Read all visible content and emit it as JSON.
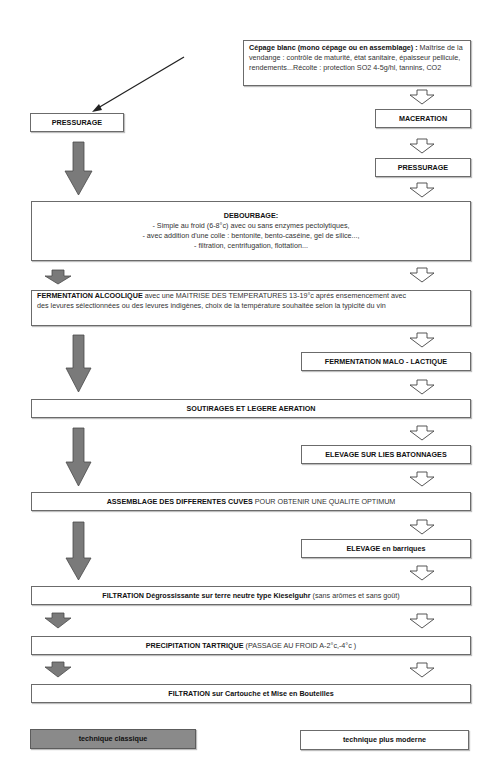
{
  "diagram": {
    "start_box": {
      "title": "Cépage blanc (mono cépage ou en assemblage) :",
      "line1_rest": " Maîtrise de la",
      "line2": "vendange : contrôle de maturité, état sanitaire, épaisseur pellicule,",
      "line3": "rendements...Récolte : protection SO2 4-5g/hl, tannins, CO2"
    },
    "left_branch": {
      "pressurage": "PRESSURAGE"
    },
    "right_branch": {
      "maceration": "MACERATION",
      "pressurage": "PRESSURAGE",
      "malo": "FERMENTATION MALO - LACTIQUE",
      "elevage_lies": "ELEVAGE SUR LIES BATONNAGES",
      "elevage_barriques_bold": "ELEVAGE",
      "elevage_barriques_rest": " en barriques"
    },
    "debourbage": {
      "title": "DEBOURBAGE:",
      "items": [
        "- Simple au froid (6-8°c) avec ou sans enzymes pectolytiques,",
        "- avec addition d'une colle : bentonite, bento-caséine, gel de silice...,",
        "- filtration, centrifugation, flottation..."
      ]
    },
    "fermentation": {
      "bold": "FERMENTATION ALCOOLIQUE",
      "line1_rest": " avec une MAITRISE DES TEMPERATURES 13-19°c aprés ensemencement avec",
      "line2": "des levures sélectionnées ou des levures indigènes, choix de la température souhaitée selon la typicité du vin"
    },
    "soutirages": "SOUTIRAGES ET LEGERE AERATION",
    "assemblage": {
      "bold": "ASSEMBLAGE DES DIFFERENTES CUVES",
      "rest": " POUR OBTENIR UNE QUALITE OPTIMUM"
    },
    "filtration1": {
      "bold": "FILTRATION Dégrossissante sur terre neutre type Kieselguhr",
      "rest": " (sans arômes et sans goût)"
    },
    "precipitation": {
      "bold": "PRECIPITATION TARTRIQUE",
      "rest": " (PASSAGE AU FROID A-2°c,-4°c )"
    },
    "filtration2": "FILTRATION sur Cartouche et Mise en Bouteilles",
    "legend": {
      "classic": "technique classique",
      "modern": "technique plus moderne"
    },
    "colors": {
      "classic_arrow": "#7a7a7a",
      "border": "#6b6b6b",
      "modern_arrow": "#ffffff"
    }
  }
}
